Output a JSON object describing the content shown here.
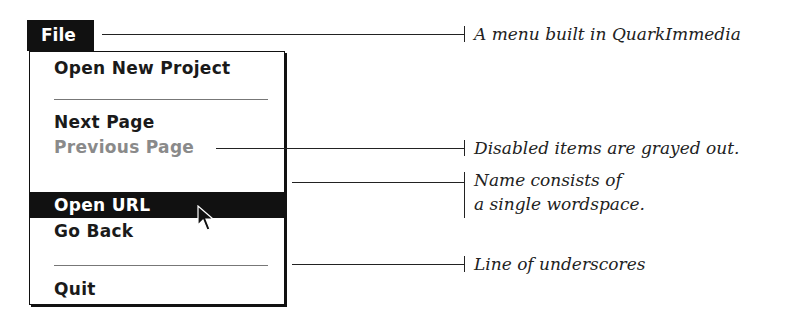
{
  "menu": {
    "title": "File",
    "items": [
      {
        "label": "Open New Project",
        "state": "enabled"
      },
      {
        "label": "Next Page",
        "state": "enabled"
      },
      {
        "label": "Previous Page",
        "state": "disabled"
      },
      {
        "label": " ",
        "state": "enabled"
      },
      {
        "label": "Open URL",
        "state": "selected"
      },
      {
        "label": "Go Back",
        "state": "enabled"
      },
      {
        "label": "Quit",
        "state": "enabled"
      }
    ]
  },
  "annotations": {
    "menu_built": "A menu built in QuarkImmedia",
    "disabled": "Disabled items are grayed out.",
    "wordspace_line1": "Name consists of",
    "wordspace_line2": "a single wordspace.",
    "underscores": "Line of underscores"
  },
  "colors": {
    "menu_fg": "#111111",
    "disabled": "#8a8a8a",
    "highlight": "#111111"
  }
}
